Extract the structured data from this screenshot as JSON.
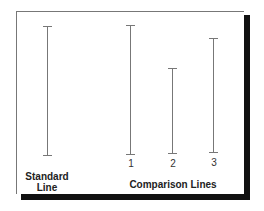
{
  "diagram": {
    "standard": {
      "label_line1": "Standard",
      "label_line2": "Line"
    },
    "comparison": {
      "group_label": "Comparison Lines",
      "lines": [
        {
          "number": "1"
        },
        {
          "number": "2"
        },
        {
          "number": "3"
        }
      ]
    }
  },
  "colors": {
    "line": "#777777",
    "shadow": "#111111",
    "text": "#222222"
  }
}
